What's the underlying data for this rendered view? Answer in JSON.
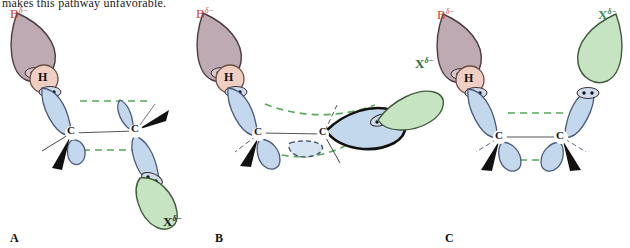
{
  "page": {
    "top_text": "makes this pathway unfavorable.",
    "background": "#ffffff"
  },
  "palette": {
    "orbital_blue_fill": "#c3d8ec",
    "orbital_blue_stroke": "#4a5a78",
    "base_mauve_fill": "#bdaab2",
    "base_mauve_stroke": "#4a3c42",
    "hydrogen_fill": "#f0cfc2",
    "hydrogen_stroke": "#6b4f45",
    "leaving_green_fill": "#c6e3c2",
    "leaving_green_stroke": "#3f5c3c",
    "dashed_green": "#5aa85a",
    "bond_gray": "#555555",
    "wedge_black": "#111111",
    "label_B_color": "#cf4233",
    "label_X_color_a": "#1a1a1a",
    "label_X_color_b": "#2f6b3a",
    "label_X_color_c": "#3f8a55",
    "label_H_color": "#111111",
    "label_C_color": "#111111"
  },
  "panels": [
    {
      "id": "A",
      "label": "A",
      "conformation": "anti-periplanar",
      "atoms": {
        "base": {
          "symbol": "B",
          "charge": "δ−",
          "color": "#cf4233"
        },
        "hydrogen": {
          "symbol": "H"
        },
        "carbon_left": {
          "symbol": "C"
        },
        "carbon_right": {
          "symbol": "C"
        },
        "leaving_group": {
          "symbol": "X",
          "charge": "δ−",
          "color": "#1a1a1a"
        }
      },
      "alignment_lines": 2,
      "wedges": 2
    },
    {
      "id": "B",
      "label": "B",
      "conformation": "syn-periplanar-eclipsed",
      "atoms": {
        "base": {
          "symbol": "B",
          "charge": "δ−",
          "color": "#cf4233"
        },
        "hydrogen": {
          "symbol": "H"
        },
        "carbon_left": {
          "symbol": "C"
        },
        "carbon_right": {
          "symbol": "C"
        },
        "leaving_group": {
          "symbol": "X",
          "charge": "δ−",
          "color": "#2f6b3a"
        }
      },
      "alignment_lines": 2,
      "wedges": 1
    },
    {
      "id": "C",
      "label": "C",
      "conformation": "syn-periplanar",
      "atoms": {
        "base": {
          "symbol": "B",
          "charge": "δ−",
          "color": "#cf4233"
        },
        "hydrogen": {
          "symbol": "H"
        },
        "carbon_left": {
          "symbol": "C"
        },
        "carbon_right": {
          "symbol": "C"
        },
        "leaving_group": {
          "symbol": "X",
          "charge": "δ−",
          "color": "#3f8a55"
        }
      },
      "alignment_lines": 2,
      "wedges": 2
    }
  ],
  "labels": {
    "panel_a": "A",
    "panel_b": "B",
    "panel_c": "C",
    "B_symbol": "B",
    "H_symbol": "H",
    "C_symbol": "C",
    "X_symbol": "X",
    "delta_minus": "δ−"
  }
}
